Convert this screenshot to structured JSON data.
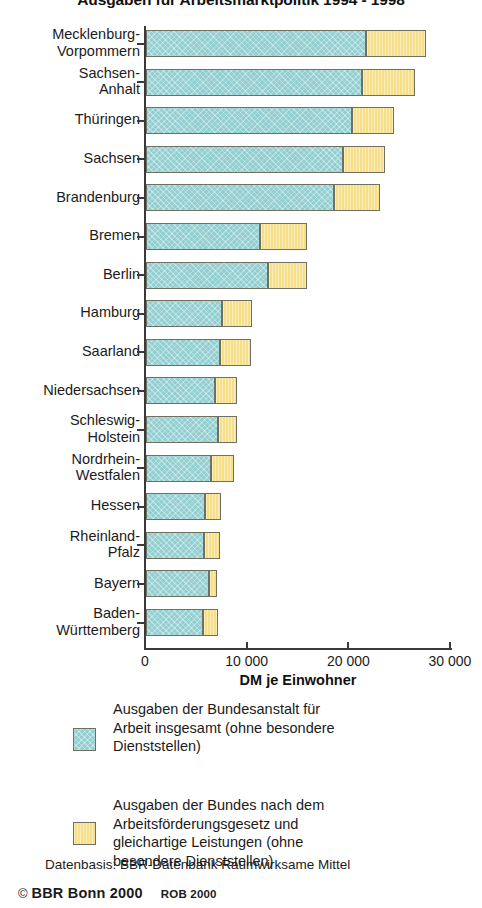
{
  "chart_data": {
    "type": "bar",
    "orientation": "horizontal",
    "stacked": true,
    "title": "Ausgaben für Arbeitsmarktpolitik 1994 - 1998",
    "xlabel": "DM je Einwohner",
    "ylabel": "",
    "xlim": [
      0,
      30000
    ],
    "xticks": [
      0,
      10000,
      20000,
      30000
    ],
    "xtick_labels": [
      "0",
      "10 000",
      "20 000",
      "30 000"
    ],
    "grid": false,
    "legend_position": "bottom",
    "categories": [
      "Mecklenburg-\nVorpommern",
      "Sachsen-\nAnhalt",
      "Thüringen",
      "Sachsen",
      "Brandenburg",
      "Bremen",
      "Berlin",
      "Hamburg",
      "Saarland",
      "Niedersachsen",
      "Schleswig-\nHolstein",
      "Nordrhein-\nWestfalen",
      "Hessen",
      "Rheinland-\nPfalz",
      "Bayern",
      "Baden-\nWürttemberg"
    ],
    "series": [
      {
        "name": "Ausgaben der Bundesanstalt für Arbeit insgesamt (ohne besondere Dienststellen)",
        "color": "#93cfd0",
        "values": [
          21600,
          21200,
          20300,
          19400,
          18500,
          11200,
          12000,
          7500,
          7300,
          6800,
          7100,
          6400,
          5800,
          5700,
          6200,
          5600
        ]
      },
      {
        "name": "Ausgaben der Bundes nach dem Arbeitsförderungsgesetz und gleichartige Leistungen (ohne besondere Dienststellen)",
        "color": "#f7df89",
        "values": [
          5900,
          5300,
          4100,
          4100,
          4500,
          4600,
          3800,
          2900,
          3000,
          2200,
          1900,
          2300,
          1550,
          1550,
          800,
          1450
        ]
      }
    ],
    "totals": [
      27500,
      26500,
      24400,
      23500,
      23000,
      15800,
      15800,
      10400,
      10300,
      9000,
      9000,
      8700,
      7350,
      7250,
      7000,
      7050
    ]
  },
  "legend": {
    "entries": [
      {
        "swatch_color": "#93cfd0",
        "label": "Ausgaben der Bundesanstalt für\nArbeit insgesamt (ohne besondere\nDienststellen)"
      },
      {
        "swatch_color": "#f7df89",
        "label": "Ausgaben der Bundes nach dem\nArbeitsförderungsgesetz und\ngleichartige Leistungen (ohne\nbesondere Dienststellen)"
      }
    ]
  },
  "footer": {
    "source_note": "Datenbasis: BBR-Datenbank Raumwirksame Mittel",
    "copyright_symbol": "©",
    "copyright_text": "BBR Bonn 2000",
    "rob_text": "ROB 2000"
  }
}
